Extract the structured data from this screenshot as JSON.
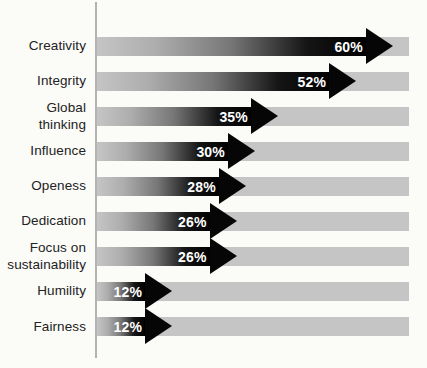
{
  "chart_data": {
    "type": "bar",
    "orientation": "horizontal",
    "title": "",
    "xlabel": "",
    "ylabel": "",
    "grid": false,
    "legend": false,
    "bar_style": "gradient-arrow",
    "xlim": [
      0,
      64
    ],
    "categories": [
      "Creativity",
      "Integrity",
      "Global thinking",
      "Influence",
      "Openess",
      "Dedication",
      "Focus on sustainability",
      "Humility",
      "Fairness"
    ],
    "values": [
      60,
      52,
      35,
      30,
      28,
      26,
      26,
      12,
      12
    ],
    "value_labels": [
      "60%",
      "52%",
      "35%",
      "30%",
      "28%",
      "26%",
      "26%",
      "12%",
      "12%"
    ],
    "colors": {
      "track": "#c5c5c5",
      "arrow_gradient_start": "#c5c5c5",
      "arrow_gradient_end": "#000000",
      "value_text": "#ffffff",
      "category_text": "#222222",
      "axis_line": "#b3b3b3",
      "background": "#fbfbf8"
    }
  }
}
